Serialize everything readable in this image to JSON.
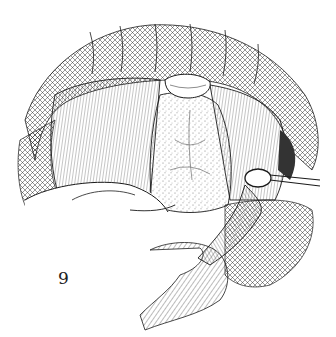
{
  "figure": {
    "label": "9",
    "colors": {
      "ink": "#1a1a1a",
      "paper": "#ffffff",
      "shade": "#555555"
    }
  }
}
